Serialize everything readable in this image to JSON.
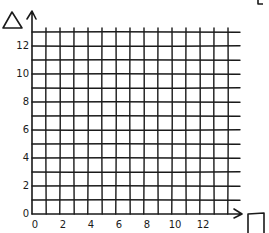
{
  "diagram": {
    "type": "hand-drawn coordinate grid",
    "y_axis_symbol": "triangle",
    "x_axis_symbol": "square",
    "stroke_color": "#1a1a1a",
    "background": "#ffffff",
    "grid": {
      "x_cells": 14,
      "y_cells": 13,
      "origin_px": [
        32,
        214
      ],
      "cell_px": 14.0
    },
    "x_ticks": [
      {
        "value": "0",
        "index": 0
      },
      {
        "value": "2",
        "index": 2
      },
      {
        "value": "4",
        "index": 4
      },
      {
        "value": "6",
        "index": 6
      },
      {
        "value": "8",
        "index": 8
      },
      {
        "value": "10",
        "index": 10
      },
      {
        "value": "12",
        "index": 12
      }
    ],
    "y_ticks": [
      {
        "value": "0",
        "index": 0
      },
      {
        "value": "2",
        "index": 2
      },
      {
        "value": "4",
        "index": 4
      },
      {
        "value": "6",
        "index": 6
      },
      {
        "value": "8",
        "index": 8
      },
      {
        "value": "10",
        "index": 10
      },
      {
        "value": "12",
        "index": 12
      }
    ]
  }
}
